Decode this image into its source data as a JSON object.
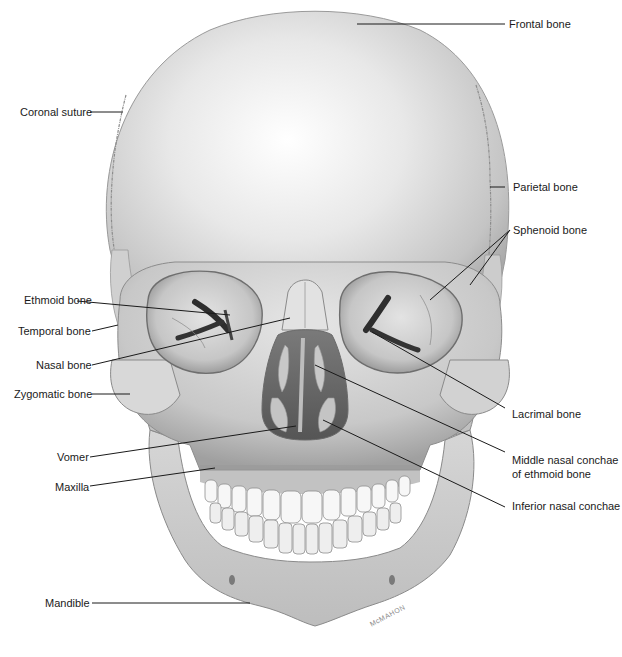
{
  "figure": {
    "signature": "McMAHON"
  },
  "labels": {
    "frontal_bone": "Frontal bone",
    "coronal_suture": "Coronal suture",
    "parietal_bone": "Parietal bone",
    "sphenoid_bone": "Sphenoid bone",
    "ethmoid_bone": "Ethmoid bone",
    "temporal_bone": "Temporal bone",
    "nasal_bone": "Nasal bone",
    "zygomatic_bone": "Zygomatic bone",
    "lacrimal_bone": "Lacrimal bone",
    "middle_nasal_conchae_line1": "Middle nasal conchae",
    "middle_nasal_conchae_line2": "of ethmoid bone",
    "vomer": "Vomer",
    "maxilla": "Maxilla",
    "inferior_nasal_conchae": "Inferior nasal conchae",
    "mandible": "Mandible"
  },
  "colors": {
    "background": "#ffffff",
    "bone_light": "#f2f2f2",
    "bone_mid": "#cfcfcf",
    "bone_dark": "#9a9a9a",
    "cavity": "#3a3a3a",
    "leader_line": "#1a1a1a",
    "text": "#1a1a1a"
  }
}
